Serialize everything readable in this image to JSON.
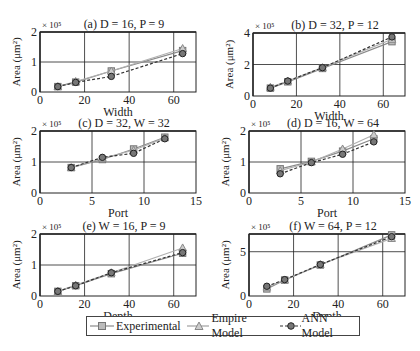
{
  "chart_data": [
    {
      "id": "a",
      "type": "line",
      "title": "(a) D = 16, P = 9",
      "xlabel": "Width",
      "ylabel": "Area (μm²)",
      "y_multiplier": "× 10⁵",
      "xlim": [
        0,
        70
      ],
      "ylim": [
        0,
        2
      ],
      "xticks": [
        0,
        20,
        40,
        60
      ],
      "yticks": [
        0,
        1,
        2
      ],
      "grid": true,
      "x": [
        8,
        16,
        32,
        64
      ],
      "series": [
        {
          "name": "Experimental",
          "values": [
            0.18,
            0.33,
            0.7,
            1.38
          ]
        },
        {
          "name": "Empire Model",
          "values": [
            0.18,
            0.35,
            0.7,
            1.45
          ]
        },
        {
          "name": "ANN Model",
          "values": [
            0.18,
            0.32,
            0.52,
            1.28
          ]
        }
      ]
    },
    {
      "id": "b",
      "type": "line",
      "title": "(b) D = 32, P = 12",
      "xlabel": "Width",
      "ylabel": "Area (μm²)",
      "y_multiplier": "× 10⁵",
      "xlim": [
        0,
        70
      ],
      "ylim": [
        0,
        4
      ],
      "xticks": [
        0,
        20,
        40,
        60
      ],
      "yticks": [
        0,
        2,
        4
      ],
      "grid": true,
      "x": [
        8,
        16,
        32,
        64
      ],
      "series": [
        {
          "name": "Experimental",
          "values": [
            0.5,
            0.9,
            1.75,
            3.45
          ]
        },
        {
          "name": "Empire Model",
          "values": [
            0.55,
            0.95,
            1.8,
            3.6
          ]
        },
        {
          "name": "ANN Model",
          "values": [
            0.5,
            0.95,
            1.8,
            3.75
          ]
        }
      ]
    },
    {
      "id": "c",
      "type": "line",
      "title": "(c) D = 32, W = 32",
      "xlabel": "Port",
      "ylabel": "Area (μm²)",
      "y_multiplier": "× 10⁵",
      "xlim": [
        0,
        15
      ],
      "ylim": [
        0,
        2
      ],
      "xticks": [
        0,
        5,
        10,
        15
      ],
      "yticks": [
        0,
        1,
        2
      ],
      "grid": true,
      "x": [
        3,
        6,
        9,
        12
      ],
      "series": [
        {
          "name": "Experimental",
          "values": [
            0.82,
            1.08,
            1.42,
            1.8
          ]
        },
        {
          "name": "Empire Model",
          "values": [
            0.82,
            1.12,
            1.38,
            1.78
          ]
        },
        {
          "name": "ANN Model",
          "values": [
            0.82,
            1.15,
            1.28,
            1.75
          ]
        }
      ]
    },
    {
      "id": "d",
      "type": "line",
      "title": "(d) D = 16, W = 64",
      "xlabel": "Port",
      "ylabel": "Area (μm²)",
      "y_multiplier": "× 10⁵",
      "xlim": [
        0,
        15
      ],
      "ylim": [
        0,
        2
      ],
      "xticks": [
        0,
        5,
        10,
        15
      ],
      "yticks": [
        0,
        1,
        2
      ],
      "grid": true,
      "x": [
        3,
        6,
        9,
        12
      ],
      "series": [
        {
          "name": "Experimental",
          "values": [
            0.78,
            1.02,
            1.35,
            1.75
          ]
        },
        {
          "name": "Empire Model",
          "values": [
            0.72,
            1.0,
            1.42,
            1.88
          ]
        },
        {
          "name": "ANN Model",
          "values": [
            0.62,
            0.98,
            1.25,
            1.65
          ]
        }
      ]
    },
    {
      "id": "e",
      "type": "line",
      "title": "(e) W = 16, P = 9",
      "xlabel": "Depth",
      "ylabel": "Area (μm²)",
      "y_multiplier": "× 10⁵",
      "xlim": [
        0,
        70
      ],
      "ylim": [
        0,
        2
      ],
      "xticks": [
        0,
        20,
        40,
        60
      ],
      "yticks": [
        0,
        1,
        2
      ],
      "grid": true,
      "x": [
        8,
        16,
        32,
        64
      ],
      "series": [
        {
          "name": "Experimental",
          "values": [
            0.15,
            0.33,
            0.72,
            1.38
          ]
        },
        {
          "name": "Empire Model",
          "values": [
            0.15,
            0.35,
            0.75,
            1.55
          ]
        },
        {
          "name": "ANN Model",
          "values": [
            0.15,
            0.33,
            0.75,
            1.4
          ]
        }
      ]
    },
    {
      "id": "f",
      "type": "line",
      "title": "(f) W = 64, P = 12",
      "xlabel": "Depth",
      "ylabel": "Area (μm²)",
      "y_multiplier": "× 10⁵",
      "xlim": [
        0,
        70
      ],
      "ylim": [
        0,
        7
      ],
      "xticks": [
        0,
        20,
        40,
        60
      ],
      "yticks": [
        0,
        5
      ],
      "grid": true,
      "x": [
        8,
        16,
        32,
        64
      ],
      "series": [
        {
          "name": "Experimental",
          "values": [
            0.8,
            1.8,
            3.5,
            6.9
          ]
        },
        {
          "name": "Empire Model",
          "values": [
            1.0,
            1.8,
            3.55,
            6.5
          ]
        },
        {
          "name": "ANN Model",
          "values": [
            1.1,
            1.85,
            3.55,
            6.7
          ]
        }
      ]
    }
  ],
  "legend": {
    "position": "bottom-center",
    "items": [
      {
        "label": "Experimental",
        "marker": "square",
        "style": "solid",
        "color": "#8a8a8a"
      },
      {
        "label": "Empire Model",
        "marker": "triangle",
        "style": "solid",
        "color": "#a0a0a0"
      },
      {
        "label": "ANN Model",
        "marker": "circle",
        "style": "dashed",
        "color": "#333333"
      }
    ]
  },
  "colors": {
    "experimental": "#8a8a8a",
    "empire": "#b0b0b0",
    "ann": "#333333",
    "axis": "#222222",
    "grid": "#222222"
  }
}
